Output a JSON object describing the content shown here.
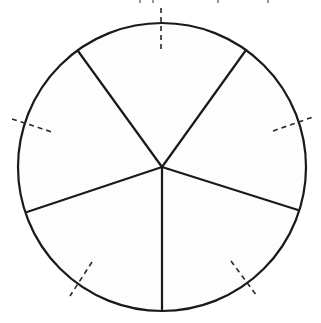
{
  "diagram": {
    "type": "circle-divided-into-sectors",
    "canvas": {
      "width": 321,
      "height": 323
    },
    "colors": {
      "stroke": "#1a1a1a",
      "fill": "#fdfdfd",
      "background": "#ffffff",
      "dashed": "#2a2a2a"
    },
    "circle": {
      "cx": 162,
      "cy": 167,
      "r": 144
    },
    "sector_count": 5,
    "radial_lines": [
      {
        "name": "upper-left",
        "x2": 78,
        "y2": 51
      },
      {
        "name": "upper-right",
        "x2": 246,
        "y2": 50
      },
      {
        "name": "lower-right",
        "x2": 298,
        "y2": 210
      },
      {
        "name": "bottom",
        "x2": 162,
        "y2": 311
      },
      {
        "name": "lower-left",
        "x2": 27,
        "y2": 212
      }
    ],
    "dashed_ticks": [
      {
        "name": "top",
        "x1": 161,
        "y1": 8,
        "x2": 161,
        "y2": 50
      },
      {
        "name": "right",
        "x1": 273,
        "y1": 131,
        "x2": 313,
        "y2": 117
      },
      {
        "name": "bottom-right",
        "x1": 231,
        "y1": 261,
        "x2": 257,
        "y2": 296
      },
      {
        "name": "bottom-left",
        "x1": 92,
        "y1": 262,
        "x2": 70,
        "y2": 296
      },
      {
        "name": "left",
        "x1": 12,
        "y1": 119,
        "x2": 52,
        "y2": 132
      }
    ],
    "top_edge_fragments": [
      {
        "x": 140,
        "y": 0,
        "h": 3
      },
      {
        "x": 153,
        "y": 0,
        "h": 3
      },
      {
        "x": 218,
        "y": 0,
        "h": 3
      },
      {
        "x": 268,
        "y": 0,
        "h": 3
      }
    ]
  }
}
